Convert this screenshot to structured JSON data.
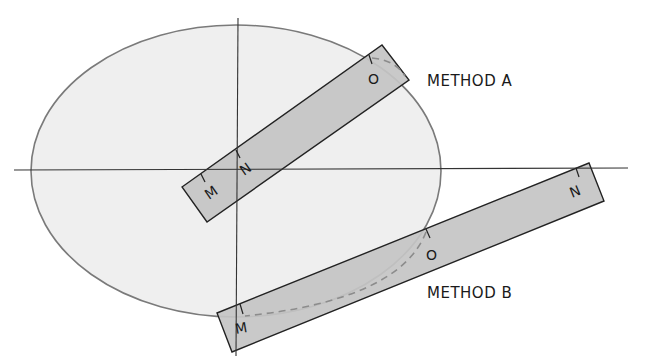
{
  "colors": {
    "background": "#ffffff",
    "ellipse_fill": "#efefef",
    "ellipse_stroke": "#7a7a7a",
    "strip_fill": "#c4c4c4",
    "strip_stroke": "#222222",
    "axis": "#333333",
    "dash": "#8c8c8c",
    "text": "#1a1a1a"
  },
  "ellipse": {
    "cx": 236,
    "cy": 171,
    "rx": 205,
    "ry": 146
  },
  "axes": {
    "horizontal": {
      "x1": 14,
      "y1": 170,
      "x2": 628,
      "y2": 168
    },
    "vertical": {
      "x1": 238,
      "y1": 18,
      "x2": 236,
      "y2": 356
    }
  },
  "methods": [
    {
      "label": "METHOD A",
      "label_pos": {
        "x": 427,
        "y": 86
      },
      "strip": {
        "points": "182,187 382,45 409,80 207,222"
      },
      "marks": [
        {
          "name": "M",
          "tick": {
            "x1": 201,
            "y1": 174,
            "x2": 205,
            "y2": 182
          },
          "pos": {
            "x": 209,
            "y": 200
          },
          "rot": -35
        },
        {
          "name": "N",
          "tick": {
            "x1": 236,
            "y1": 150,
            "x2": 240,
            "y2": 158
          },
          "pos": {
            "x": 244,
            "y": 176
          },
          "rot": -35
        },
        {
          "name": "O",
          "tick": {
            "x1": 369,
            "y1": 55,
            "x2": 372,
            "y2": 64
          },
          "pos": {
            "x": 368,
            "y": 84
          },
          "rot": 0
        }
      ],
      "dash_path": "M 372 58 Q 395 60 405 76"
    },
    {
      "label": "METHOD B",
      "label_pos": {
        "x": 427,
        "y": 298
      },
      "strip": {
        "points": "217,313 589,163 604,201 232,352"
      },
      "marks": [
        {
          "name": "M",
          "tick": {
            "x1": 240,
            "y1": 304,
            "x2": 243,
            "y2": 314
          },
          "pos": {
            "x": 236,
            "y": 334
          },
          "rot": -10
        },
        {
          "name": "O",
          "tick": {
            "x1": 426,
            "y1": 229,
            "x2": 430,
            "y2": 238
          },
          "pos": {
            "x": 426,
            "y": 260
          },
          "rot": 0
        },
        {
          "name": "N",
          "tick": {
            "x1": 576,
            "y1": 168,
            "x2": 579,
            "y2": 177
          },
          "pos": {
            "x": 572,
            "y": 198
          },
          "rot": -22
        }
      ],
      "dash_path": "M 426 232 Q 400 300 245 316"
    }
  ]
}
